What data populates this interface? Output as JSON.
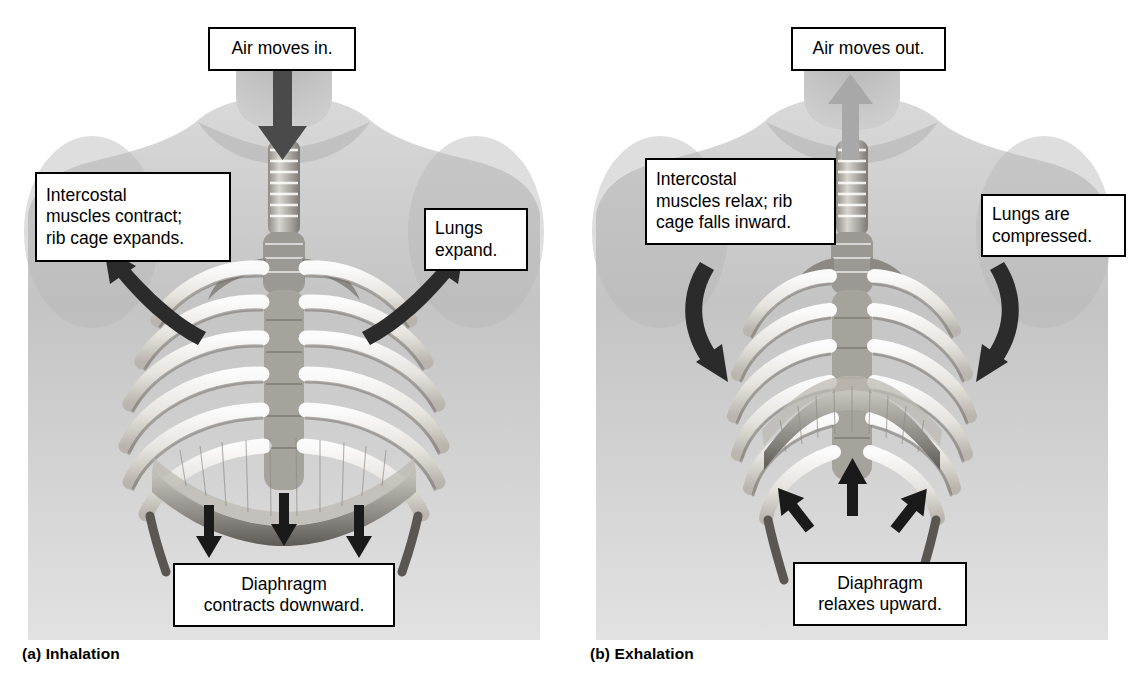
{
  "figure": {
    "background": "#ffffff",
    "ink": "#000000"
  },
  "panels": [
    {
      "id": "a",
      "caption": "(a) Inhalation",
      "air_flow_arrow": {
        "direction": "down",
        "color": "#4a4a4a",
        "label": "air-in-arrow"
      },
      "callouts": {
        "air": "Air moves in.",
        "intercostal": "Intercostal\nmuscles contract;\nrib cage expands.",
        "lungs": "Lungs\nexpand.",
        "diaphragm": "Diaphragm\ncontracts downward."
      },
      "rib_arrows": {
        "direction": "outward-up",
        "color": "#2b2b2b",
        "count": 2
      },
      "diaphragm_arrows": {
        "direction": "down",
        "color": "#1a1a1a",
        "count": 3
      },
      "diaphragm_shape": "flattened-dome"
    },
    {
      "id": "b",
      "caption": "(b) Exhalation",
      "air_flow_arrow": {
        "direction": "up",
        "color": "#a8a8a8",
        "label": "air-out-arrow"
      },
      "callouts": {
        "air": "Air moves out.",
        "intercostal": "Intercostal\nmuscles relax; rib\ncage falls inward.",
        "lungs": "Lungs are\ncompressed.",
        "diaphragm": "Diaphragm\nrelaxes upward."
      },
      "rib_arrows": {
        "direction": "inward-down",
        "color": "#2b2b2b",
        "count": 2
      },
      "diaphragm_arrows": {
        "direction": "up",
        "color": "#1a1a1a",
        "count": 3
      },
      "diaphragm_shape": "raised-dome"
    }
  ],
  "anatomy": {
    "parts": [
      "torso-silhouette",
      "neck",
      "shoulders",
      "trachea",
      "bronchi",
      "sternum",
      "rib-cage",
      "diaphragm"
    ],
    "style": "grayscale-photographic-illustration"
  }
}
